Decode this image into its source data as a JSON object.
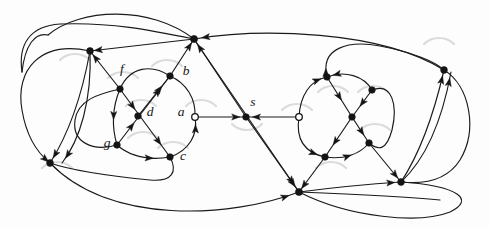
{
  "figure": {
    "background_color": "#fdfdfd",
    "edge_color": "#1a1a1a",
    "node_fill_color": "#141414",
    "open_node_fill_color": "#ffffff",
    "faint_arc_color": "#cfcfcf",
    "width": 489,
    "height": 228
  },
  "labels": [
    {
      "id": "f",
      "text": "f",
      "x": 122,
      "y": 70,
      "style": "italic"
    },
    {
      "id": "b",
      "text": "b",
      "x": 186,
      "y": 72,
      "style": "italic"
    },
    {
      "id": "d",
      "text": "d",
      "x": 150,
      "y": 113,
      "style": "italic"
    },
    {
      "id": "a",
      "text": "a",
      "x": 181,
      "y": 113,
      "style": "italic"
    },
    {
      "id": "g",
      "text": "g",
      "x": 107,
      "y": 144,
      "style": "italic"
    },
    {
      "id": "c",
      "text": "c",
      "x": 183,
      "y": 157,
      "style": "italic"
    },
    {
      "id": "s",
      "text": "s",
      "x": 253,
      "y": 103,
      "style": "italic"
    }
  ],
  "nodes": [
    {
      "id": "n-top-hub",
      "name": "top-center-hub",
      "x": 194,
      "y": 39,
      "kind": "filled",
      "r": 3.6
    },
    {
      "id": "n-bottom-hub",
      "name": "bottom-center-hub",
      "x": 299,
      "y": 192,
      "kind": "filled",
      "r": 3.6
    },
    {
      "id": "n-left-hub",
      "name": "left-upper-hub",
      "x": 90,
      "y": 51,
      "kind": "filled",
      "r": 3.4
    },
    {
      "id": "n-lowleft-hub",
      "name": "lower-left-hub",
      "x": 50,
      "y": 163,
      "kind": "filled",
      "r": 3.4
    },
    {
      "id": "n-right-hub",
      "name": "right-upper-hub",
      "x": 444,
      "y": 70,
      "kind": "filled",
      "r": 3.4
    },
    {
      "id": "n-lowright-hub",
      "name": "lower-right-hub",
      "x": 401,
      "y": 182,
      "kind": "filled",
      "r": 3.4
    },
    {
      "id": "n-f",
      "name": "vertex-f",
      "x": 120,
      "y": 89,
      "kind": "filled",
      "r": 3.3
    },
    {
      "id": "n-b",
      "name": "vertex-b",
      "x": 170,
      "y": 76,
      "kind": "filled",
      "r": 3.3
    },
    {
      "id": "n-d",
      "name": "vertex-d",
      "x": 138,
      "y": 116,
      "kind": "filled",
      "r": 3.3
    },
    {
      "id": "n-a",
      "name": "vertex-a",
      "x": 195,
      "y": 117,
      "kind": "open",
      "r": 3.3
    },
    {
      "id": "n-g",
      "name": "vertex-g",
      "x": 117,
      "y": 145,
      "kind": "filled",
      "r": 3.3
    },
    {
      "id": "n-c",
      "name": "vertex-c",
      "x": 170,
      "y": 157,
      "kind": "filled",
      "r": 3.3
    },
    {
      "id": "n-s",
      "name": "vertex-s",
      "x": 246,
      "y": 117,
      "kind": "filled",
      "r": 3.3
    },
    {
      "id": "n-r-open",
      "name": "right-cluster-entry",
      "x": 299,
      "y": 117,
      "kind": "open",
      "r": 3.3
    },
    {
      "id": "n-r-top",
      "name": "right-cluster-top",
      "x": 327,
      "y": 77,
      "kind": "filled",
      "r": 3.3
    },
    {
      "id": "n-r-tr",
      "name": "right-cluster-upper-right",
      "x": 372,
      "y": 90,
      "kind": "filled",
      "r": 3.3
    },
    {
      "id": "n-r-mid",
      "name": "right-cluster-center",
      "x": 352,
      "y": 117,
      "kind": "filled",
      "r": 3.3
    },
    {
      "id": "n-r-br",
      "name": "right-cluster-lower-right",
      "x": 369,
      "y": 143,
      "kind": "filled",
      "r": 3.3
    },
    {
      "id": "n-r-bot",
      "name": "right-cluster-bottom",
      "x": 325,
      "y": 157,
      "kind": "filled",
      "r": 3.3
    }
  ],
  "edges": [
    {
      "name": "edge-outer-top-left-sweep",
      "d": "M 90,51 C 40,40 15,70 22,110 C 27,140 40,155 50,163",
      "arrows": [
        {
          "t": 0.99,
          "dir": "forward"
        }
      ]
    },
    {
      "name": "edge-outer-top-arc",
      "d": "M 48,35 C 80,8 150,5 194,39",
      "arrows": []
    },
    {
      "name": "edge-topleft-curve-in",
      "d": "M 22,72 C 25,45 35,32 48,35",
      "arrows": []
    },
    {
      "name": "edge-lefthub-to-tophub",
      "d": "M 90,51 L 194,39",
      "arrows": [
        {
          "t": 0.04,
          "dir": "backward"
        }
      ]
    },
    {
      "name": "edge-righthub-to-tophub",
      "d": "M 444,70 C 380,30 260,28 194,39",
      "arrows": [
        {
          "t": 0.97,
          "dir": "forward"
        }
      ]
    },
    {
      "name": "edge-tophub-to-bottomhub",
      "d": "M 194,39 L 299,192",
      "arrows": [
        {
          "t": 0.95,
          "dir": "forward"
        }
      ]
    },
    {
      "name": "edge-s-up-to-tophub",
      "d": "M 246,117 L 194,39",
      "arrows": [
        {
          "t": 0.93,
          "dir": "forward"
        }
      ]
    },
    {
      "name": "edge-s-down-to-bottomhub",
      "d": "M 246,117 L 299,192",
      "arrows": [
        {
          "t": 0.93,
          "dir": "forward"
        }
      ]
    },
    {
      "name": "edge-a-to-s",
      "d": "M 195,117 L 246,117",
      "arrows": [
        {
          "t": 0.88,
          "dir": "forward"
        }
      ]
    },
    {
      "name": "edge-ropen-to-s",
      "d": "M 299,117 L 246,117",
      "arrows": [
        {
          "t": 0.88,
          "dir": "forward"
        }
      ]
    },
    {
      "name": "edge-b-to-tophub",
      "d": "M 170,76 L 194,39",
      "arrows": [
        {
          "t": 0.9,
          "dir": "forward"
        }
      ]
    },
    {
      "name": "edge-f-to-lefthub",
      "d": "M 120,89 L 90,51",
      "arrows": [
        {
          "t": 0.9,
          "dir": "forward"
        }
      ]
    },
    {
      "name": "edge-f-to-b",
      "d": "M 120,89 C 130,66 152,64 170,76",
      "arrows": []
    },
    {
      "name": "edge-b-to-d",
      "d": "M 170,76 L 138,116",
      "arrows": [
        {
          "t": 0.25,
          "dir": "backward"
        }
      ]
    },
    {
      "name": "edge-f-to-d-diag",
      "d": "M 120,89 L 170,157",
      "arrows": [
        {
          "t": 0.3,
          "dir": "forward"
        },
        {
          "t": 0.82,
          "dir": "forward"
        }
      ]
    },
    {
      "name": "edge-g-to-b-diag",
      "d": "M 117,145 L 170,76",
      "arrows": [
        {
          "t": 0.32,
          "dir": "forward"
        },
        {
          "t": 0.82,
          "dir": "forward"
        }
      ]
    },
    {
      "name": "edge-f-to-g",
      "d": "M 120,89 C 112,108 112,128 117,145",
      "arrows": [
        {
          "t": 0.55,
          "dir": "forward"
        }
      ]
    },
    {
      "name": "edge-g-to-c",
      "d": "M 117,145 C 132,158 152,160 170,157",
      "arrows": [
        {
          "t": 0.7,
          "dir": "forward"
        }
      ]
    },
    {
      "name": "edge-c-to-a-arc",
      "d": "M 170,157 C 190,150 198,134 195,117",
      "arrows": [
        {
          "t": 0.85,
          "dir": "forward"
        }
      ]
    },
    {
      "name": "edge-a-to-b-arc",
      "d": "M 195,117 C 196,98 186,83 170,76",
      "arrows": []
    },
    {
      "name": "edge-g-left-loop",
      "d": "M 117,145 C 92,152 72,142 75,120 C 78,100 98,94 120,89",
      "arrows": []
    },
    {
      "name": "edge-c-bottom-loop",
      "d": "M 170,157 C 178,172 172,182 150,180 C 110,176 70,170 50,163",
      "arrows": []
    },
    {
      "name": "edge-lefthub-down-1",
      "d": "M 90,51 C 82,95 68,135 50,163",
      "arrows": [
        {
          "t": 0.95,
          "dir": "forward"
        }
      ]
    },
    {
      "name": "edge-lefthub-down-2",
      "d": "M 90,51 C 92,100 80,140 62,163",
      "arrows": [
        {
          "t": 0.95,
          "dir": "forward"
        }
      ]
    },
    {
      "name": "edge-lowleft-to-bottomhub",
      "d": "M 50,163 C 110,225 230,218 299,192",
      "arrows": [
        {
          "t": 0.96,
          "dir": "forward"
        }
      ]
    },
    {
      "name": "edge-bottomhub-to-lowright",
      "d": "M 299,192 C 330,188 370,184 401,182",
      "arrows": [
        {
          "t": 0.94,
          "dir": "forward"
        }
      ]
    },
    {
      "name": "edge-lowright-outer-loop",
      "d": "M 401,182 C 460,186 475,200 450,212 C 420,224 350,218 299,192",
      "arrows": []
    },
    {
      "name": "edge-r-open-to-rtop",
      "d": "M 299,117 C 300,96 310,80 327,77",
      "arrows": [
        {
          "t": 0.88,
          "dir": "forward"
        }
      ]
    },
    {
      "name": "edge-rtop-to-rtr",
      "d": "M 327,77 C 345,70 364,76 372,90",
      "arrows": [
        {
          "t": 0.12,
          "dir": "backward"
        }
      ]
    },
    {
      "name": "edge-rtop-to-rmid",
      "d": "M 327,77 L 352,117",
      "arrows": [
        {
          "t": 0.58,
          "dir": "forward"
        }
      ]
    },
    {
      "name": "edge-rtr-to-rmid",
      "d": "M 372,90 L 352,117",
      "arrows": [
        {
          "t": 0.6,
          "dir": "forward"
        }
      ]
    },
    {
      "name": "edge-rmid-to-rbr",
      "d": "M 352,117 L 369,143",
      "arrows": [
        {
          "t": 0.7,
          "dir": "forward"
        }
      ]
    },
    {
      "name": "edge-rmid-to-rbot",
      "d": "M 352,117 L 325,157",
      "arrows": [
        {
          "t": 0.7,
          "dir": "forward"
        }
      ]
    },
    {
      "name": "edge-rbot-to-ropen",
      "d": "M 325,157 C 302,152 296,136 299,117",
      "arrows": [
        {
          "t": 0.15,
          "dir": "backward"
        }
      ]
    },
    {
      "name": "edge-rbot-to-rbr-arc",
      "d": "M 325,157 C 344,160 360,154 369,143",
      "arrows": [
        {
          "t": 0.55,
          "dir": "forward"
        }
      ]
    },
    {
      "name": "edge-rtr-loop-right",
      "d": "M 372,90 C 392,82 398,105 392,130 C 386,152 378,150 369,143",
      "arrows": []
    },
    {
      "name": "edge-rtop-top-loop",
      "d": "M 327,77 C 320,48 348,40 380,46 C 412,52 436,62 444,70",
      "arrows": [
        {
          "t": 0.06,
          "dir": "forward"
        }
      ]
    },
    {
      "name": "edge-rbr-to-lowright",
      "d": "M 369,143 L 401,182",
      "arrows": [
        {
          "t": 0.9,
          "dir": "forward"
        }
      ]
    },
    {
      "name": "edge-rbot-to-bottomhub",
      "d": "M 325,157 L 299,192",
      "arrows": [
        {
          "t": 0.9,
          "dir": "forward"
        }
      ]
    },
    {
      "name": "edge-lowright-up-to-righthub",
      "d": "M 401,182 C 422,150 436,105 444,70",
      "arrows": [
        {
          "t": 0.95,
          "dir": "forward"
        }
      ]
    },
    {
      "name": "edge-lowright-up-2",
      "d": "M 401,182 C 430,155 444,110 451,72",
      "arrows": [
        {
          "t": 0.95,
          "dir": "forward"
        }
      ]
    },
    {
      "name": "edge-righthub-right-loop",
      "d": "M 444,70 C 470,86 478,130 460,160 C 446,182 420,184 401,182",
      "arrows": []
    },
    {
      "name": "edge-bottomhub-right-line",
      "d": "M 299,192 C 350,194 400,196 440,200",
      "arrows": []
    },
    {
      "name": "edge-tophub-left-long",
      "d": "M 194,39 C 150,30 110,22 60,24 C 30,26 18,44 22,72",
      "arrows": []
    }
  ],
  "faint_arcs": [
    {
      "name": "faint-arc-1",
      "d": "M 108,78 C 116,70 130,70 138,78"
    },
    {
      "name": "faint-arc-2",
      "d": "M 152,66 C 160,58 174,58 182,66"
    },
    {
      "name": "faint-arc-3",
      "d": "M 126,106 C 134,98 148,98 156,106"
    },
    {
      "name": "faint-arc-4",
      "d": "M 186,106 C 194,98 208,98 216,106"
    },
    {
      "name": "faint-arc-5",
      "d": "M 128,138 C 136,130 150,130 158,138"
    },
    {
      "name": "faint-arc-6",
      "d": "M 158,148 C 166,140 180,140 188,148"
    },
    {
      "name": "faint-arc-7",
      "d": "M 232,124 C 240,132 254,132 262,124"
    },
    {
      "name": "faint-arc-8",
      "d": "M 282,110 C 290,102 304,102 312,110"
    },
    {
      "name": "faint-arc-9",
      "d": "M 318,92 C 326,84 340,84 348,92"
    },
    {
      "name": "faint-arc-10",
      "d": "M 358,92 C 366,84 380,84 388,92"
    },
    {
      "name": "faint-arc-11",
      "d": "M 360,130 C 368,122 382,122 390,130"
    },
    {
      "name": "faint-arc-12",
      "d": "M 316,168 C 324,160 338,160 346,168"
    },
    {
      "name": "faint-arc-13",
      "d": "M 60,60 C 68,52 82,52 90,60"
    },
    {
      "name": "faint-arc-14",
      "d": "M 42,168 C 50,160 64,160 72,168"
    },
    {
      "name": "faint-arc-15",
      "d": "M 424,44 C 432,36 446,36 454,44"
    }
  ]
}
